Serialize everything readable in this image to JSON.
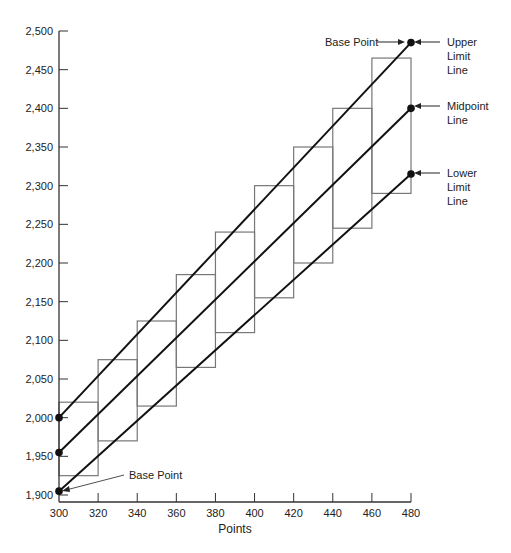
{
  "chart_data": {
    "type": "line",
    "title": "",
    "xlabel": "Points",
    "ylabel": "",
    "xlim": [
      300,
      480
    ],
    "ylim": [
      1900,
      2500
    ],
    "grid": false,
    "x_ticks": [
      300,
      320,
      340,
      360,
      380,
      400,
      420,
      440,
      460,
      480
    ],
    "x_tick_labels": [
      "300",
      "320",
      "340",
      "360",
      "380",
      "400",
      "420",
      "440",
      "460",
      "480"
    ],
    "y_ticks": [
      1900,
      1950,
      2000,
      2050,
      2100,
      2150,
      2200,
      2250,
      2300,
      2350,
      2400,
      2450,
      2500
    ],
    "y_tick_labels": [
      "1,900",
      "1,950",
      "2,000",
      "2,050",
      "2,100",
      "2,150",
      "2,200",
      "2,250",
      "2,300",
      "2,350",
      "2,400",
      "2,450",
      "2,500"
    ],
    "series": [
      {
        "name": "Upper Limit Line",
        "x": [
          300,
          480
        ],
        "values": [
          2000,
          2485
        ]
      },
      {
        "name": "Midpoint Line",
        "x": [
          300,
          480
        ],
        "values": [
          1955,
          2400
        ]
      },
      {
        "name": "Lower Limit Line",
        "x": [
          300,
          480
        ],
        "values": [
          1905,
          2315
        ]
      }
    ],
    "step_boxes": [
      {
        "x0": 300,
        "x1": 320,
        "low": 1925,
        "high": 2020
      },
      {
        "x0": 320,
        "x1": 340,
        "low": 1970,
        "high": 2075
      },
      {
        "x0": 340,
        "x1": 360,
        "low": 2015,
        "high": 2125
      },
      {
        "x0": 360,
        "x1": 380,
        "low": 2065,
        "high": 2185
      },
      {
        "x0": 380,
        "x1": 400,
        "low": 2110,
        "high": 2240
      },
      {
        "x0": 400,
        "x1": 420,
        "low": 2155,
        "high": 2300
      },
      {
        "x0": 420,
        "x1": 440,
        "low": 2200,
        "high": 2350
      },
      {
        "x0": 440,
        "x1": 460,
        "low": 2245,
        "high": 2400
      },
      {
        "x0": 460,
        "x1": 480,
        "low": 2290,
        "high": 2465
      }
    ],
    "annotations": [
      {
        "text": "Base Point",
        "target": [
          480,
          2485
        ]
      },
      {
        "text": "Upper Limit Line",
        "target": [
          480,
          2485
        ]
      },
      {
        "text": "Midpoint Line",
        "target": [
          480,
          2400
        ]
      },
      {
        "text": "Lower Limit Line",
        "target": [
          480,
          2315
        ]
      },
      {
        "text": "Base Point",
        "target": [
          300,
          1905
        ]
      }
    ],
    "legend_position": "none"
  },
  "labels": {
    "x_axis_title": "Points",
    "base_point_top": "Base Point",
    "base_point_bottom": "Base Point",
    "upper_limit": [
      "Upper",
      "Limit",
      "Line"
    ],
    "midpoint": [
      "Midpoint",
      "Line"
    ],
    "lower_limit": [
      "Lower",
      "Limit",
      "Line"
    ]
  }
}
